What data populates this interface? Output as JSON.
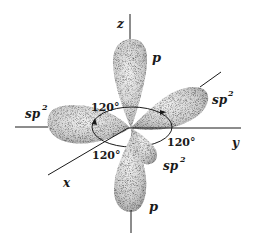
{
  "diagram": {
    "axes": {
      "x": {
        "label": "x"
      },
      "y": {
        "label": "y"
      },
      "z": {
        "label": "z"
      }
    },
    "orbitals": {
      "p_upper": {
        "label": "p"
      },
      "p_lower": {
        "label": "p"
      },
      "sp2_right": {
        "label": "sp",
        "sup": "2"
      },
      "sp2_left": {
        "label": "sp",
        "sup": "2"
      },
      "sp2_front": {
        "label": "sp",
        "sup": "2"
      }
    },
    "angles": [
      {
        "label": "120°"
      },
      {
        "label": "120°"
      },
      {
        "label": "120°"
      }
    ],
    "colors": {
      "ink": "#1a1a1a",
      "lobe_fill": "#d9d9d9",
      "lobe_shade": "#9a9a9a",
      "background": "#ffffff"
    }
  }
}
